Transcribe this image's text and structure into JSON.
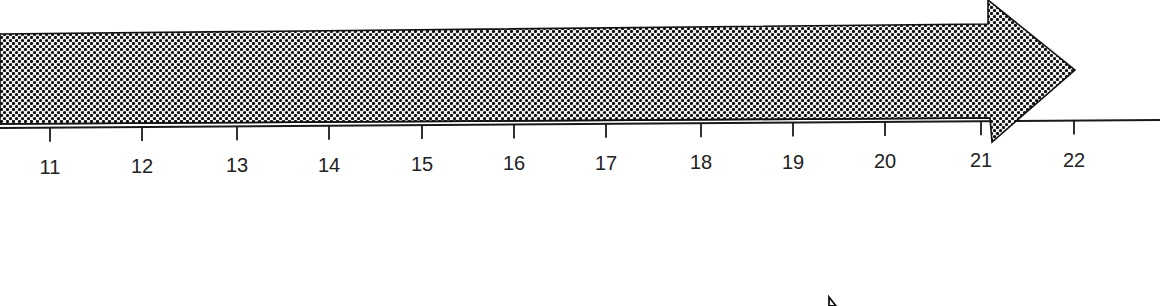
{
  "diagram": {
    "type": "timeline-arrow",
    "axis": {
      "ticks": [
        "11",
        "12",
        "13",
        "14",
        "15",
        "16",
        "17",
        "18",
        "19",
        "20",
        "21",
        "22"
      ],
      "tick_x": [
        50,
        142,
        237,
        329,
        422,
        514,
        606,
        701,
        793,
        885,
        981,
        1074
      ],
      "line_color": "#1a1a1a"
    },
    "arrow": {
      "fill_pattern": "halftone-dots",
      "dot_color": "#111111",
      "bg_color": "#f2f2f2",
      "outline_color": "#111111"
    }
  }
}
